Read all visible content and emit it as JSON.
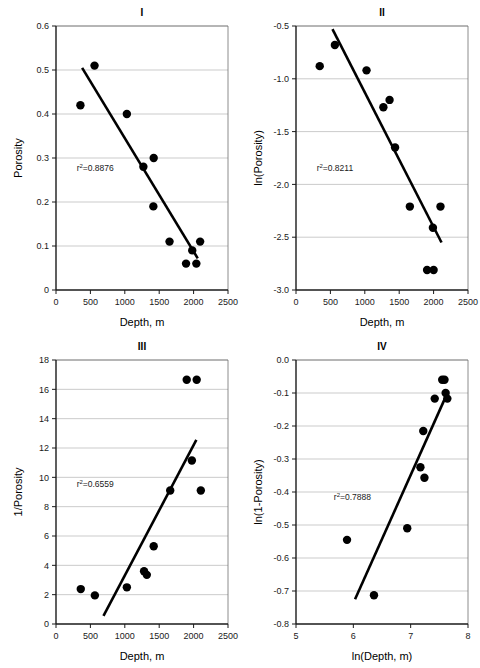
{
  "figure": {
    "panel_count": 4,
    "point_color": "#000000",
    "trendline_color": "#000000",
    "gridline_color": "#b4b4b4"
  },
  "chart_data": [
    {
      "type": "scatter",
      "title": "I",
      "xlabel": "Depth, m",
      "ylabel": "Porosity",
      "xlim": [
        0,
        2500
      ],
      "ylim": [
        0,
        0.6
      ],
      "xticks": [
        0,
        500,
        1000,
        1500,
        2000,
        2500
      ],
      "xticklabels": [
        "0",
        "500",
        "1000",
        "1500",
        "2000",
        "2500"
      ],
      "yticks": [
        0,
        0.1,
        0.2,
        0.3,
        0.4,
        0.5,
        0.6
      ],
      "yticklabels": [
        "0",
        "0.1",
        "0.2",
        "0.3",
        "0.4",
        "0.5",
        "0.6"
      ],
      "grid": true,
      "annotation": "r2=0.8876",
      "annotation_prefix": "r",
      "annotation_sup": "2",
      "annotation_suffix": "=0.8876",
      "r_squared": 0.8876,
      "x": [
        355,
        560,
        1030,
        1270,
        1420,
        1415,
        1650,
        1890,
        1980,
        2040,
        2095
      ],
      "y": [
        0.42,
        0.51,
        0.4,
        0.28,
        0.3,
        0.19,
        0.11,
        0.06,
        0.09,
        0.06,
        0.11
      ],
      "trend": {
        "x1": 380,
        "y1": 0.505,
        "x2": 2060,
        "y2": 0.072
      }
    },
    {
      "type": "scatter",
      "title": "II",
      "xlabel": "Depth, m",
      "ylabel": "ln(Porosity)",
      "xlim": [
        0,
        2500
      ],
      "ylim": [
        -3.0,
        -0.5
      ],
      "xticks": [
        0,
        500,
        1000,
        1500,
        2000,
        2500
      ],
      "xticklabels": [
        "0",
        "500",
        "1000",
        "1500",
        "2000",
        "2500"
      ],
      "yticks": [
        -3.0,
        -2.5,
        -2.0,
        -1.5,
        -1.0,
        -0.5
      ],
      "yticklabels": [
        "-3.0",
        "-2.5",
        "-2.0",
        "-1.5",
        "-1.0",
        "-0.5"
      ],
      "grid": true,
      "annotation": "r2=0.8211",
      "annotation_prefix": "r",
      "annotation_sup": "2",
      "annotation_suffix": "=0.8211",
      "r_squared": 0.8211,
      "x": [
        345,
        565,
        1025,
        1270,
        1360,
        1440,
        1655,
        1905,
        1990,
        2000,
        2100
      ],
      "y": [
        -0.88,
        -0.68,
        -0.92,
        -1.27,
        -1.2,
        -1.65,
        -2.21,
        -2.81,
        -2.41,
        -2.81,
        -2.21
      ],
      "trend": {
        "x1": 530,
        "y1": -0.53,
        "x2": 2115,
        "y2": -2.55
      }
    },
    {
      "type": "scatter",
      "title": "III",
      "xlabel": "Depth, m",
      "ylabel": "1/Porosity",
      "xlim": [
        0,
        2500
      ],
      "ylim": [
        0,
        18
      ],
      "xticks": [
        0,
        500,
        1000,
        1500,
        2000,
        2500
      ],
      "xticklabels": [
        "0",
        "500",
        "1000",
        "1500",
        "2000",
        "2500"
      ],
      "yticks": [
        0,
        2,
        4,
        6,
        8,
        10,
        12,
        14,
        16,
        18
      ],
      "yticklabels": [
        "0",
        "2",
        "4",
        "6",
        "8",
        "10",
        "12",
        "14",
        "16",
        "18"
      ],
      "grid": true,
      "annotation": "r2=0.6559",
      "annotation_prefix": "r",
      "annotation_sup": "2",
      "annotation_suffix": "=0.6559",
      "r_squared": 0.6559,
      "x": [
        360,
        565,
        1030,
        1280,
        1320,
        1420,
        1660,
        1900,
        1975,
        2045,
        2105
      ],
      "y": [
        2.38,
        1.95,
        2.5,
        3.6,
        3.35,
        5.3,
        9.1,
        16.65,
        11.15,
        16.65,
        9.1
      ],
      "trend": {
        "x1": 690,
        "y1": 0.55,
        "x2": 2040,
        "y2": 12.55
      }
    },
    {
      "type": "scatter",
      "title": "IV",
      "xlabel": "ln(Depth, m)",
      "ylabel": "ln(1-Porosity)",
      "xlim": [
        5,
        8
      ],
      "ylim": [
        -0.8,
        0.0
      ],
      "xticks": [
        5,
        6,
        7,
        8
      ],
      "xticklabels": [
        "5",
        "6",
        "7",
        "8"
      ],
      "yticks": [
        -0.8,
        -0.7,
        -0.6,
        -0.5,
        -0.4,
        -0.3,
        -0.2,
        -0.1,
        0.0
      ],
      "yticklabels": [
        "-0.8",
        "-0.7",
        "-0.6",
        "-0.5",
        "-0.4",
        "-0.3",
        "-0.2",
        "-0.1",
        "0.0"
      ],
      "grid": true,
      "annotation": "r2=0.7888",
      "annotation_prefix": "r",
      "annotation_sup": "2",
      "annotation_suffix": "=0.7888",
      "r_squared": 0.7888,
      "x": [
        5.89,
        6.36,
        6.94,
        7.17,
        7.22,
        7.24,
        7.42,
        7.55,
        7.59,
        7.61,
        7.64
      ],
      "y": [
        -0.545,
        -0.713,
        -0.51,
        -0.325,
        -0.215,
        -0.357,
        -0.117,
        -0.06,
        -0.06,
        -0.1,
        -0.117
      ],
      "trend": {
        "x1": 6.03,
        "y1": -0.725,
        "x2": 7.62,
        "y2": -0.108
      }
    }
  ]
}
